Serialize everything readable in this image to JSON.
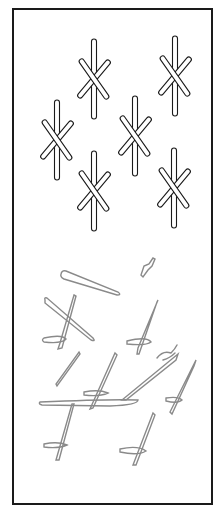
{
  "figure": {
    "type": "asterisk-pattern-copy-test",
    "top_panel": {
      "stimulus_count": 6,
      "stroke_color": "#1a1a1a"
    },
    "bottom_panel": {
      "copy_stroke_color": "#8a8a8a",
      "annotation": "oe"
    }
  }
}
